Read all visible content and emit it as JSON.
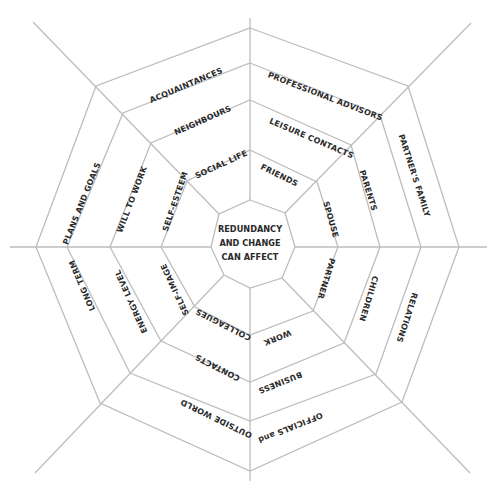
{
  "diagram": {
    "type": "spider-web",
    "style": {
      "line_color": "#bdbdbd",
      "text_color": "#2a2a2a",
      "background": "#ffffff"
    },
    "center": {
      "lines": [
        "REDUNDANCY",
        "AND CHANGE",
        "CAN AFFECT"
      ]
    },
    "segments": {
      "top_right": [
        "FRIENDS",
        "LEISURE CONTACTS",
        "PROFESSIONAL ADVISORS"
      ],
      "right_upper": [
        "SPOUSE",
        "PARENTS",
        "PARTNER'S FAMILY"
      ],
      "right_lower": [
        "PARTNER",
        "CHILDREN",
        "RELATIONS"
      ],
      "bottom_right": [
        "WORK",
        "BUSINESS",
        "OFFICIALS and"
      ],
      "bottom_left": [
        "COLLEAGUES",
        "CONTACTS",
        "OUTSIDE WORLD"
      ],
      "left_lower": [
        "SELF-IMAGE",
        "ENERGY LEVEL",
        "LONG TERM"
      ],
      "left_upper": [
        "SELF-ESTEEM",
        "WILL TO WORK",
        "PLANS AND GOALS"
      ],
      "top_left": [
        "SOCIAL LIFE",
        "NEIGHBOURS",
        "ACQUAINTANCES"
      ]
    }
  }
}
